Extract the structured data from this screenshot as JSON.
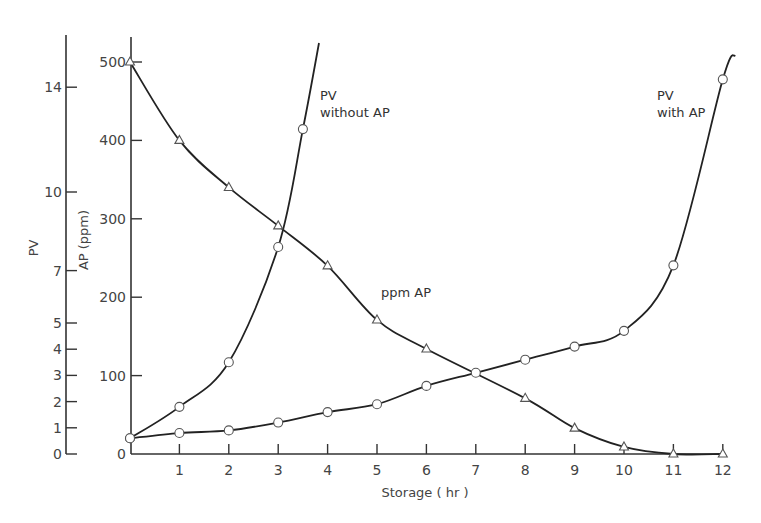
{
  "chart_data": {
    "type": "line",
    "title": "",
    "xlabel": "Storage ( hr )",
    "ylabel_left_outer": "PV",
    "ylabel_left_inner": "AP (ppm)",
    "xlim": [
      0,
      12
    ],
    "x_ticks": [
      1,
      2,
      3,
      4,
      5,
      6,
      7,
      8,
      9,
      10,
      11,
      12
    ],
    "x_origin_label": "0",
    "pv_axis": {
      "label": "PV",
      "ticks": [
        0,
        1,
        2,
        3,
        4,
        5,
        7,
        10,
        14
      ],
      "range": [
        0,
        16
      ]
    },
    "ap_axis": {
      "label": "AP (ppm)",
      "ticks": [
        0,
        100,
        200,
        300,
        400,
        500
      ],
      "range": [
        0,
        530
      ]
    },
    "grid": false,
    "legend": "inline annotations",
    "series": [
      {
        "name": "PV without AP",
        "axis": "PV",
        "marker": "circle",
        "annotation": [
          "PV",
          "without AP"
        ],
        "x": [
          0,
          1,
          2,
          3,
          3.5
        ],
        "values": [
          0.6,
          1.8,
          3.5,
          7.9,
          12.4
        ]
      },
      {
        "name": "PV with AP",
        "axis": "PV",
        "marker": "circle",
        "annotation": [
          "PV",
          "with AP"
        ],
        "x": [
          0,
          1,
          2,
          3,
          4,
          5,
          6,
          7,
          8,
          9,
          10,
          11,
          12
        ],
        "values": [
          0.6,
          0.8,
          0.9,
          1.2,
          1.6,
          1.9,
          2.6,
          3.1,
          3.6,
          4.1,
          4.7,
          7.2,
          14.3
        ]
      },
      {
        "name": "ppm AP",
        "axis": "AP (ppm)",
        "marker": "triangle",
        "annotation": [
          "ppm AP"
        ],
        "x": [
          0,
          1,
          2,
          3,
          4,
          5,
          6,
          8,
          9,
          10,
          11,
          12
        ],
        "values": [
          500,
          400,
          340,
          291,
          240,
          171,
          134,
          71,
          33,
          9,
          0,
          0
        ]
      }
    ]
  }
}
